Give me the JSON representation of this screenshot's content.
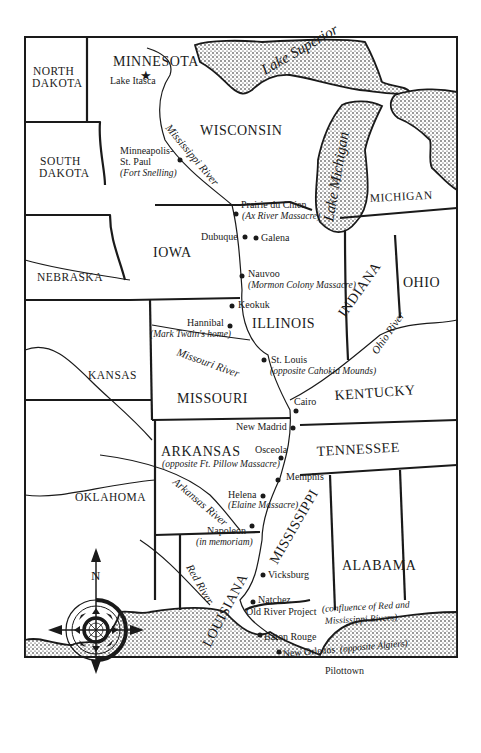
{
  "map": {
    "title": "Mississippi River region map",
    "states": {
      "minnesota": "MINNESOTA",
      "north_dakota_1": "NORTH",
      "north_dakota_2": "DAKOTA",
      "south_dakota_1": "SOUTH",
      "south_dakota_2": "DAKOTA",
      "wisconsin": "WISCONSIN",
      "michigan": "MICHIGAN",
      "iowa": "IOWA",
      "nebraska": "NEBRASKA",
      "illinois": "ILLINOIS",
      "indiana": "INDIANA",
      "ohio": "OHIO",
      "kansas": "KANSAS",
      "missouri": "MISSOURI",
      "kentucky": "KENTUCKY",
      "tennessee": "TENNESSEE",
      "arkansas": "ARKANSAS",
      "oklahoma": "OKLAHOMA",
      "mississippi": "MISSISSIPPI",
      "alabama": "ALABAMA",
      "louisiana": "LOUISIANA"
    },
    "water": {
      "lake_superior": "Lake Superior",
      "lake_michigan": "Lake Michigan",
      "mississippi_river": "Mississippi River",
      "missouri_river": "Missouri River",
      "ohio_river": "Ohio River",
      "arkansas_river": "Arkansas River",
      "red_river": "Red River"
    },
    "places": [
      {
        "name": "Lake Itasca",
        "note": ""
      },
      {
        "name": "Minneapolis-",
        "name2": "St. Paul",
        "note": "(Fort Snelling)"
      },
      {
        "name": "Prairie du Chien",
        "note": "(Ax River Massacre)"
      },
      {
        "name": "Dubuque",
        "note": ""
      },
      {
        "name": "Galena",
        "note": ""
      },
      {
        "name": "Nauvoo",
        "note": "(Mormon Colony Massacre)"
      },
      {
        "name": "Keokuk",
        "note": ""
      },
      {
        "name": "Hannibal",
        "note": "(Mark Twain's home)"
      },
      {
        "name": "St. Louis",
        "note": "(opposite Cahokia Mounds)"
      },
      {
        "name": "Cairo",
        "note": ""
      },
      {
        "name": "New Madrid",
        "note": ""
      },
      {
        "name": "Osceola",
        "note": "(opposite Ft. Pillow Massacre)"
      },
      {
        "name": "Memphis",
        "note": ""
      },
      {
        "name": "Helena",
        "note": "(Elaine Massacre)"
      },
      {
        "name": "Napoleon",
        "note": "(in memoriam)"
      },
      {
        "name": "Vicksburg",
        "note": ""
      },
      {
        "name": "Natchez",
        "note": ""
      },
      {
        "name": "Old River Project",
        "note": "(confluence of Red and",
        "note2": "Mississippi Rivers)"
      },
      {
        "name": "Baton Rouge",
        "note": ""
      },
      {
        "name": "New Orleans",
        "note": "(opposite Algiers)"
      },
      {
        "name": "Pilottown",
        "note": ""
      }
    ],
    "compass": {
      "north_label": "N"
    },
    "colors": {
      "ink": "#1a1a1a",
      "paper": "#ffffff"
    }
  }
}
